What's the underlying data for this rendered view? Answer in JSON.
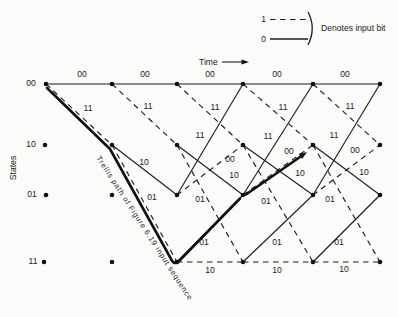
{
  "figure": {
    "kind": "convolutional-code-trellis-diagram",
    "background_color": "#fbfbf9",
    "ink_color": "#1f1f1f"
  },
  "legend": {
    "one_label": "1",
    "zero_label": "0",
    "caption": "Denotes input bit",
    "one_style": "dashed",
    "zero_style": "solid"
  },
  "axes": {
    "time_label": "Time",
    "states_label": "States"
  },
  "states": [
    {
      "name": "00"
    },
    {
      "name": "10"
    },
    {
      "name": "01"
    },
    {
      "name": "11"
    }
  ],
  "highlighted_path": {
    "note": "Trellis path of Figure 6.19 input sequence",
    "state_sequence": [
      "00",
      "10",
      "11",
      "01",
      "10"
    ],
    "input_bits": [
      1,
      1,
      0,
      1
    ]
  },
  "branches": [
    {
      "from": "00",
      "to": "00",
      "input": 0,
      "output": "00"
    },
    {
      "from": "00",
      "to": "00",
      "input": 0,
      "output": "00"
    },
    {
      "from": "00",
      "to": "00",
      "input": 0,
      "output": "00"
    },
    {
      "from": "00",
      "to": "00",
      "input": 0,
      "output": "00"
    },
    {
      "from": "00",
      "to": "00",
      "input": 0,
      "output": "00"
    },
    {
      "from": "00",
      "to": "10",
      "input": 1,
      "output": "11"
    },
    {
      "from": "00",
      "to": "10",
      "input": 1,
      "output": "11"
    },
    {
      "from": "00",
      "to": "10",
      "input": 1,
      "output": "11"
    },
    {
      "from": "00",
      "to": "10",
      "input": 1,
      "output": "11"
    },
    {
      "from": "00",
      "to": "10",
      "input": 1,
      "output": "11"
    },
    {
      "from": "10",
      "to": "01",
      "input": 0,
      "output": "10"
    },
    {
      "from": "10",
      "to": "01",
      "input": 0,
      "output": "10"
    },
    {
      "from": "10",
      "to": "01",
      "input": 0,
      "output": "10"
    },
    {
      "from": "10",
      "to": "01",
      "input": 0,
      "output": "10"
    },
    {
      "from": "10",
      "to": "11",
      "input": 1,
      "output": "01"
    },
    {
      "from": "10",
      "to": "11",
      "input": 1,
      "output": "01"
    },
    {
      "from": "10",
      "to": "11",
      "input": 1,
      "output": "01"
    },
    {
      "from": "10",
      "to": "11",
      "input": 1,
      "output": "01"
    },
    {
      "from": "01",
      "to": "00",
      "input": 0,
      "output": "11"
    },
    {
      "from": "01",
      "to": "00",
      "input": 0,
      "output": "11"
    },
    {
      "from": "01",
      "to": "00",
      "input": 0,
      "output": "11"
    },
    {
      "from": "01",
      "to": "10",
      "input": 1,
      "output": "00"
    },
    {
      "from": "01",
      "to": "10",
      "input": 1,
      "output": "00"
    },
    {
      "from": "01",
      "to": "10",
      "input": 1,
      "output": "00"
    },
    {
      "from": "11",
      "to": "01",
      "input": 0,
      "output": "01"
    },
    {
      "from": "11",
      "to": "01",
      "input": 0,
      "output": "01"
    },
    {
      "from": "11",
      "to": "01",
      "input": 0,
      "output": "01"
    },
    {
      "from": "11",
      "to": "11",
      "input": 1,
      "output": "10"
    },
    {
      "from": "11",
      "to": "11",
      "input": 1,
      "output": "10"
    },
    {
      "from": "11",
      "to": "11",
      "input": 1,
      "output": "10"
    }
  ]
}
